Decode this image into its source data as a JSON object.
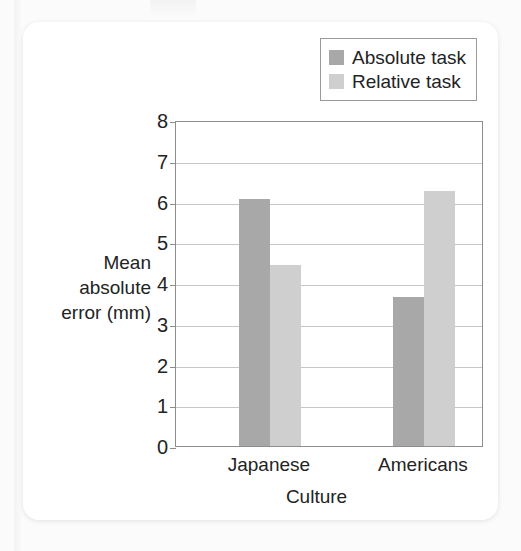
{
  "chart_data": {
    "type": "bar",
    "title": "",
    "xlabel": "Culture",
    "ylabel": "Mean absolute error (mm)",
    "ylabel_lines": [
      "Mean",
      "absolute",
      "error (mm)"
    ],
    "categories": [
      "Japanese",
      "Americans"
    ],
    "series": [
      {
        "name": "Absolute task",
        "color": "#a8a8a8",
        "values": [
          6.05,
          3.65
        ]
      },
      {
        "name": "Relative task",
        "color": "#cfcfcf",
        "values": [
          4.45,
          6.25
        ]
      }
    ],
    "ylim": [
      0,
      8
    ],
    "yticks": [
      8,
      7,
      6,
      5,
      4,
      3,
      2,
      1,
      0
    ],
    "grid": true,
    "legend_position": "top-right"
  },
  "legend": {
    "items": [
      {
        "label": "Absolute task",
        "swatch": "#a8a8a8"
      },
      {
        "label": "Relative task",
        "swatch": "#cfcfcf"
      }
    ]
  },
  "axes": {
    "y_title_line1": "Mean",
    "y_title_line2": "absolute",
    "y_title_line3": "error (mm)",
    "x_title": "Culture",
    "y_tick_0": "0",
    "y_tick_1": "1",
    "y_tick_2": "2",
    "y_tick_3": "3",
    "y_tick_4": "4",
    "y_tick_5": "5",
    "y_tick_6": "6",
    "y_tick_7": "7",
    "y_tick_8": "8",
    "x_tick_0": "Japanese",
    "x_tick_1": "Americans"
  },
  "colors": {
    "absolute_task": "#a8a8a8",
    "relative_task": "#cfcfcf",
    "gridline": "#c6c6c6",
    "frame": "#8d8d8d",
    "text": "#232323",
    "card": "#ffffff",
    "background": "#fbfbfb"
  }
}
